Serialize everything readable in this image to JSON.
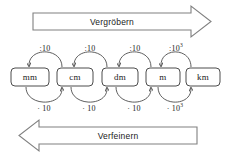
{
  "diagram": {
    "title_top_arrow": "Vergröbern",
    "title_bottom_arrow": "Verfeinern",
    "stroke_color": "#4d4d4d",
    "text_color": "#1a1a1a",
    "background_color": "#ffffff",
    "units": [
      {
        "id": "mm",
        "label": "mm",
        "cx": 30
      },
      {
        "id": "cm",
        "label": "cm",
        "cx": 75
      },
      {
        "id": "dm",
        "label": "dm",
        "cx": 120
      },
      {
        "id": "m",
        "label": "m",
        "cx": 163
      },
      {
        "id": "km",
        "label": "km",
        "cx": 203
      }
    ],
    "top_operations": [
      {
        "id": "cm-to-mm",
        "base": ":10",
        "exponent": "",
        "from": "cm",
        "to": "mm"
      },
      {
        "id": "dm-to-cm",
        "base": ":10",
        "exponent": "",
        "from": "dm",
        "to": "cm"
      },
      {
        "id": "m-to-dm",
        "base": ":10",
        "exponent": "",
        "from": "m",
        "to": "dm"
      },
      {
        "id": "km-to-m",
        "base": ":10",
        "exponent": "3",
        "from": "km",
        "to": "m"
      }
    ],
    "bottom_operations": [
      {
        "id": "mm-to-cm",
        "base": "· 10",
        "exponent": "",
        "from": "mm",
        "to": "cm"
      },
      {
        "id": "cm-to-dm",
        "base": "· 10",
        "exponent": "",
        "from": "cm",
        "to": "dm"
      },
      {
        "id": "dm-to-m",
        "base": "· 10",
        "exponent": "",
        "from": "dm",
        "to": "m"
      },
      {
        "id": "m-to-km",
        "base": "· 10",
        "exponent": "3",
        "from": "m",
        "to": "km"
      }
    ]
  }
}
